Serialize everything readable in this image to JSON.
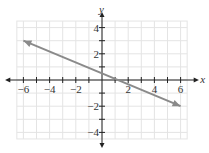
{
  "chart_data": {
    "type": "line",
    "title": "",
    "xlabel": "x",
    "ylabel": "y",
    "xlim": [
      -6,
      6
    ],
    "ylim": [
      -4,
      4
    ],
    "grid": true,
    "x_ticks": [
      -6,
      -4,
      -2,
      2,
      4,
      6
    ],
    "y_ticks": [
      4,
      2,
      -2,
      -4
    ],
    "x_tick_labels": [
      "−6",
      "−4",
      "−2",
      "2",
      "4",
      "6"
    ],
    "y_tick_labels": [
      "4",
      "2",
      "−2",
      "−4"
    ],
    "series": [
      {
        "name": "line",
        "points": [
          [
            -6,
            3
          ],
          [
            6,
            -2
          ]
        ],
        "arrows_both_ends": true,
        "color": "#8a8a8a"
      }
    ]
  },
  "colors": {
    "grid": "#e4e4e4",
    "axis": "#222222",
    "line": "#8a8a8a"
  }
}
